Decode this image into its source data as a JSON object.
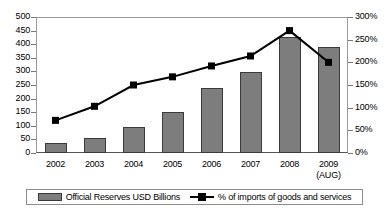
{
  "chart_data": {
    "type": "bar",
    "title": "",
    "xlabel": "",
    "ylabel": "",
    "categories": [
      "2002",
      "2003",
      "2004",
      "2005",
      "2006",
      "2007",
      "2008",
      "2009"
    ],
    "category_sublabels": [
      "",
      "",
      "",
      "",
      "",
      "",
      "",
      "(AUG)"
    ],
    "grid": false,
    "legend_position": "bottom",
    "series": [
      {
        "name": "Official Reserves USD Billions",
        "type": "bar",
        "axis": "left",
        "color": "#7d7d7d",
        "border_color": "#3a3a3a",
        "values": [
          38,
          55,
          97,
          150,
          238,
          297,
          425,
          390
        ]
      },
      {
        "name": "% of imports of goods and services",
        "type": "line",
        "axis": "right",
        "color": "#000000",
        "marker": "square",
        "values": [
          72,
          103,
          150,
          168,
          192,
          214,
          270,
          200
        ]
      }
    ],
    "left_axis": {
      "min": 0,
      "max": 500,
      "step": 50,
      "ticks": [
        "0",
        "50",
        "100",
        "150",
        "200",
        "250",
        "300",
        "350",
        "400",
        "450",
        "500"
      ]
    },
    "right_axis": {
      "min": 0,
      "max": 300,
      "step": 50,
      "suffix": "%",
      "ticks": [
        "0%",
        "50%",
        "100%",
        "150%",
        "200%",
        "250%",
        "300%"
      ]
    }
  },
  "legend": {
    "entries": [
      {
        "label": "Official Reserves USD Billions",
        "marker": "bar-swatch"
      },
      {
        "label": "% of imports of goods and services",
        "marker": "line-square-marker"
      }
    ]
  }
}
